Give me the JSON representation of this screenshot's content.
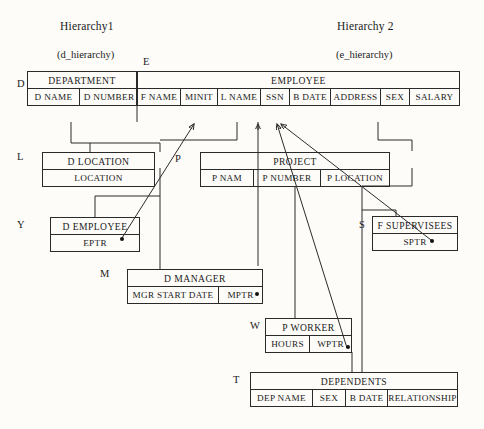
{
  "headers": {
    "left_title": "Hierarchy1",
    "left_subtitle": "(d_hierarchy)",
    "right_title": "Hierarchy 2",
    "right_subtitle": "(e_hierarchy)"
  },
  "side_tags": {
    "department": "D",
    "employee": "E",
    "d_location": "L",
    "project": "P",
    "d_employee": "Y",
    "f_supervisees": "S",
    "d_manager": "M",
    "p_worker": "W",
    "dependents": "T"
  },
  "records": {
    "department": {
      "name": "DEPARTMENT",
      "columns": [
        "D NAME",
        "D NUMBER"
      ]
    },
    "employee": {
      "name": "EMPLOYEE",
      "columns": [
        "F NAME",
        "MINIT",
        "L NAME",
        "SSN",
        "B DATE",
        "ADDRESS",
        "SEX",
        "SALARY"
      ]
    },
    "d_location": {
      "name": "D LOCATION",
      "columns": [
        "LOCATION"
      ]
    },
    "project": {
      "name": "PROJECT",
      "columns": [
        "P NAM",
        "P NUMBER",
        "P LOCATION"
      ]
    },
    "d_employee": {
      "name": "D EMPLOYEE",
      "columns": [
        "EPTR"
      ]
    },
    "f_supervisees": {
      "name": "F SUPERVISEES",
      "columns": [
        "SPTR"
      ]
    },
    "d_manager": {
      "name": "D MANAGER",
      "columns": [
        "MGR START DATE",
        "MPTR"
      ]
    },
    "p_worker": {
      "name": "P WORKER",
      "columns": [
        "HOURS",
        "WPTR"
      ]
    },
    "dependents": {
      "name": "DEPENDENTS",
      "columns": [
        "DEP NAME",
        "SEX",
        "B DATE",
        "RELATIONSHIP"
      ]
    }
  },
  "colors": {
    "ink": "#2a2a2a",
    "paper": "#fdfcf9"
  }
}
